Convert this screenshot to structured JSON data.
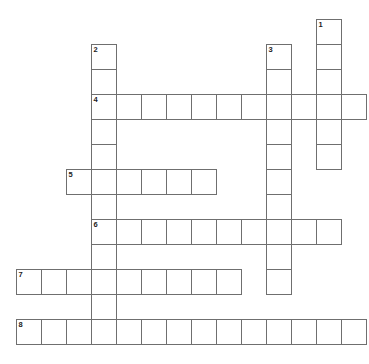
{
  "puzzle": {
    "title": "Crossword Puzzle Grid",
    "grid": {
      "cell_size": 25,
      "origin_x": 16,
      "origin_y": 19,
      "columns": 15,
      "rows": 14,
      "border_color": "#6f6f6f",
      "cell_fill": "#ffffff",
      "page_background": "#ffffff",
      "number_color": "#1c1c1c"
    },
    "entries": [
      {
        "number": "1",
        "direction": "down",
        "start_col": 12,
        "start_row": 0,
        "length": 6
      },
      {
        "number": "2",
        "direction": "down",
        "start_col": 3,
        "start_row": 1,
        "length": 12
      },
      {
        "number": "3",
        "direction": "down",
        "start_col": 10,
        "start_row": 1,
        "length": 10
      },
      {
        "number": "4",
        "direction": "across",
        "start_col": 3,
        "start_row": 3,
        "length": 11
      },
      {
        "number": "5",
        "direction": "across",
        "start_col": 2,
        "start_row": 6,
        "length": 6
      },
      {
        "number": "6",
        "direction": "across",
        "start_col": 3,
        "start_row": 8,
        "length": 10
      },
      {
        "number": "7",
        "direction": "across",
        "start_col": 0,
        "start_row": 10,
        "length": 9
      },
      {
        "number": "8",
        "direction": "across",
        "start_col": 0,
        "start_row": 12,
        "length": 14
      }
    ],
    "cells": [
      {
        "col": 12,
        "row": 0,
        "number": "1"
      },
      {
        "col": 12,
        "row": 1,
        "number": ""
      },
      {
        "col": 12,
        "row": 2,
        "number": ""
      },
      {
        "col": 12,
        "row": 3,
        "number": ""
      },
      {
        "col": 12,
        "row": 4,
        "number": ""
      },
      {
        "col": 12,
        "row": 5,
        "number": ""
      },
      {
        "col": 3,
        "row": 1,
        "number": "2"
      },
      {
        "col": 3,
        "row": 2,
        "number": ""
      },
      {
        "col": 3,
        "row": 3,
        "number": "4"
      },
      {
        "col": 3,
        "row": 4,
        "number": ""
      },
      {
        "col": 3,
        "row": 5,
        "number": ""
      },
      {
        "col": 3,
        "row": 6,
        "number": ""
      },
      {
        "col": 3,
        "row": 7,
        "number": ""
      },
      {
        "col": 3,
        "row": 8,
        "number": "6"
      },
      {
        "col": 3,
        "row": 9,
        "number": ""
      },
      {
        "col": 3,
        "row": 10,
        "number": ""
      },
      {
        "col": 3,
        "row": 11,
        "number": ""
      },
      {
        "col": 3,
        "row": 12,
        "number": ""
      },
      {
        "col": 10,
        "row": 1,
        "number": "3"
      },
      {
        "col": 10,
        "row": 2,
        "number": ""
      },
      {
        "col": 10,
        "row": 3,
        "number": ""
      },
      {
        "col": 10,
        "row": 4,
        "number": ""
      },
      {
        "col": 10,
        "row": 5,
        "number": ""
      },
      {
        "col": 10,
        "row": 6,
        "number": ""
      },
      {
        "col": 10,
        "row": 7,
        "number": ""
      },
      {
        "col": 10,
        "row": 8,
        "number": ""
      },
      {
        "col": 10,
        "row": 9,
        "number": ""
      },
      {
        "col": 10,
        "row": 10,
        "number": ""
      },
      {
        "col": 4,
        "row": 3,
        "number": ""
      },
      {
        "col": 5,
        "row": 3,
        "number": ""
      },
      {
        "col": 6,
        "row": 3,
        "number": ""
      },
      {
        "col": 7,
        "row": 3,
        "number": ""
      },
      {
        "col": 8,
        "row": 3,
        "number": ""
      },
      {
        "col": 9,
        "row": 3,
        "number": ""
      },
      {
        "col": 11,
        "row": 3,
        "number": ""
      },
      {
        "col": 13,
        "row": 3,
        "number": ""
      },
      {
        "col": 2,
        "row": 6,
        "number": "5"
      },
      {
        "col": 4,
        "row": 6,
        "number": ""
      },
      {
        "col": 5,
        "row": 6,
        "number": ""
      },
      {
        "col": 6,
        "row": 6,
        "number": ""
      },
      {
        "col": 7,
        "row": 6,
        "number": ""
      },
      {
        "col": 4,
        "row": 8,
        "number": ""
      },
      {
        "col": 5,
        "row": 8,
        "number": ""
      },
      {
        "col": 6,
        "row": 8,
        "number": ""
      },
      {
        "col": 7,
        "row": 8,
        "number": ""
      },
      {
        "col": 8,
        "row": 8,
        "number": ""
      },
      {
        "col": 9,
        "row": 8,
        "number": ""
      },
      {
        "col": 11,
        "row": 8,
        "number": ""
      },
      {
        "col": 12,
        "row": 8,
        "number": ""
      },
      {
        "col": 0,
        "row": 10,
        "number": "7"
      },
      {
        "col": 1,
        "row": 10,
        "number": ""
      },
      {
        "col": 2,
        "row": 10,
        "number": ""
      },
      {
        "col": 4,
        "row": 10,
        "number": ""
      },
      {
        "col": 5,
        "row": 10,
        "number": ""
      },
      {
        "col": 6,
        "row": 10,
        "number": ""
      },
      {
        "col": 7,
        "row": 10,
        "number": ""
      },
      {
        "col": 8,
        "row": 10,
        "number": ""
      },
      {
        "col": 0,
        "row": 12,
        "number": "8"
      },
      {
        "col": 1,
        "row": 12,
        "number": ""
      },
      {
        "col": 2,
        "row": 12,
        "number": ""
      },
      {
        "col": 4,
        "row": 12,
        "number": ""
      },
      {
        "col": 5,
        "row": 12,
        "number": ""
      },
      {
        "col": 6,
        "row": 12,
        "number": ""
      },
      {
        "col": 7,
        "row": 12,
        "number": ""
      },
      {
        "col": 8,
        "row": 12,
        "number": ""
      },
      {
        "col": 9,
        "row": 12,
        "number": ""
      },
      {
        "col": 10,
        "row": 12,
        "number": ""
      },
      {
        "col": 11,
        "row": 12,
        "number": ""
      },
      {
        "col": 12,
        "row": 12,
        "number": ""
      },
      {
        "col": 13,
        "row": 12,
        "number": ""
      }
    ]
  }
}
